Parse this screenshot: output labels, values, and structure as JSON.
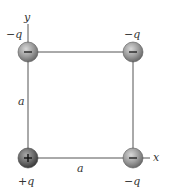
{
  "diagram": {
    "axes": {
      "x_label": "x",
      "y_label": "y"
    },
    "side_labels": {
      "left": "a",
      "bottom": "a"
    },
    "charges": [
      {
        "position": "top-left",
        "label": "−q",
        "sign": "−",
        "color": "#8a8a8a"
      },
      {
        "position": "top-right",
        "label": "−q",
        "sign": "−",
        "color": "#8a8a8a"
      },
      {
        "position": "bottom-left",
        "label": "+q",
        "sign": "+",
        "color": "#5a5a5a"
      },
      {
        "position": "bottom-right",
        "label": "−q",
        "sign": "−",
        "color": "#8a8a8a"
      }
    ],
    "line_color": "#555555"
  }
}
